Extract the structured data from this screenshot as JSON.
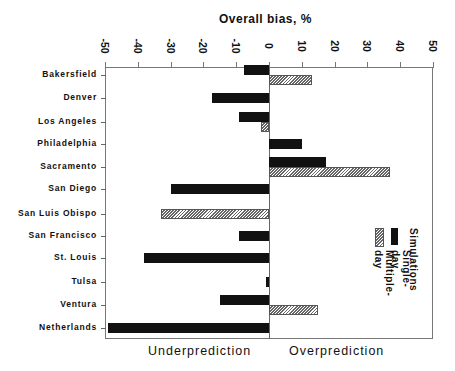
{
  "chart_data": {
    "type": "bar",
    "orientation": "horizontal",
    "title": "Overall bias, %",
    "xlabel": "Overall bias, %",
    "ylabel": "",
    "xlim": [
      -50,
      50
    ],
    "xticks": [
      "-50",
      "-40",
      "-30",
      "-20",
      "-10",
      "0",
      "10",
      "20",
      "30",
      "40",
      "50"
    ],
    "grid": false,
    "categories": [
      "Bakersfield",
      "Denver",
      "Los Angeles",
      "Philadelphia",
      "Sacramento",
      "San Diego",
      "San Luis Obispo",
      "San Francisco",
      "St. Louis",
      "Tulsa",
      "Ventura",
      "Netherlands"
    ],
    "series": [
      {
        "name": "Single-day",
        "style": "solid-black",
        "values": [
          -7.5,
          -17.5,
          -9,
          10,
          17.5,
          -30,
          null,
          -9,
          -38,
          -1,
          -15,
          -49
        ]
      },
      {
        "name": "Multiple-day",
        "style": "hatched",
        "values": [
          13,
          null,
          -2.5,
          null,
          37,
          null,
          -33,
          null,
          null,
          null,
          15,
          null
        ]
      }
    ],
    "legend": {
      "title": "Simulations",
      "entries": [
        "Single-day",
        "Multiple-day"
      ],
      "position": "right-lower, rotated"
    },
    "annotations": [
      "Underprediction",
      "Overprediction"
    ]
  },
  "labels": {
    "title": "Overall bias, %",
    "legend_title": "Simulations",
    "legend_single": "Single-day",
    "legend_multi": "Multiple-day",
    "under": "Underprediction",
    "over": "Overprediction"
  }
}
